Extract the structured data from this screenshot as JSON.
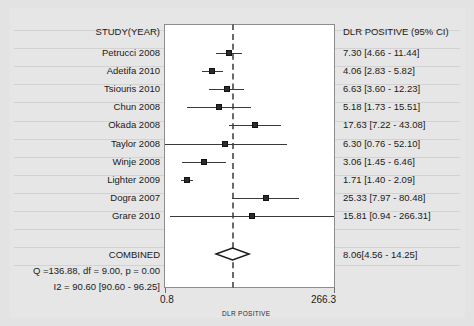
{
  "chart_data": {
    "type": "forest",
    "title": "",
    "xlabel": "DLR POSITIVE",
    "ylabel": "",
    "scale": "log",
    "xlim": [
      0.8,
      266.3
    ],
    "xticks": [
      "0.8",
      "266.3"
    ],
    "grid": true,
    "reference_line": 8.06,
    "columns": {
      "study": "STUDY(YEAR)",
      "result": "DLR POSITIVE (95% CI)"
    },
    "categories": [
      "Petrucci 2008",
      "Adetifa 2010",
      "Tsiouris 2010",
      "Chun 2008",
      "Okada 2008",
      "Taylor 2008",
      "Winje 2008",
      "Lighter 2009",
      "Dogra 2007",
      "Grare 2010"
    ],
    "values": [
      7.3,
      4.06,
      6.63,
      5.18,
      17.63,
      6.3,
      3.06,
      1.71,
      25.33,
      15.81
    ],
    "ci_low": [
      4.66,
      2.83,
      3.6,
      1.73,
      7.22,
      0.76,
      1.45,
      1.4,
      7.97,
      0.94
    ],
    "ci_high": [
      11.44,
      5.82,
      12.23,
      15.51,
      43.08,
      52.1,
      6.46,
      2.09,
      80.48,
      266.31
    ],
    "labels": [
      "7.30 [4.66 - 11.44]",
      "4.06 [2.83 - 5.82]",
      "6.63 [3.60 - 12.23]",
      "5.18 [1.73 - 15.51]",
      "17.63 [7.22 - 43.08]",
      "6.30 [0.76 - 52.10]",
      "3.06 [1.45 - 6.46]",
      "1.71 [1.40 - 2.09]",
      "25.33 [7.97 - 80.48]",
      "15.81 [0.94 - 266.31]"
    ],
    "summary": {
      "label": "COMBINED",
      "value": 8.06,
      "ci_low": 4.56,
      "ci_high": 14.25,
      "result_label": "8.06[4.56 - 14.25]"
    },
    "heterogeneity": [
      "Q =136.88, df = 9.00, p =  0.00",
      "I2 = 90.60 [90.60 - 96.25]"
    ]
  }
}
